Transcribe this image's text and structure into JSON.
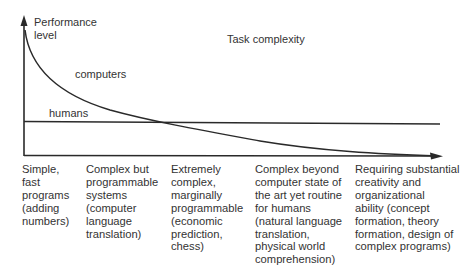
{
  "diagram": {
    "y_axis_label_line1": "Performance",
    "y_axis_label_line2": "level",
    "x_axis_title": "Task complexity",
    "series": {
      "computers": {
        "label": "computers",
        "color": "#2a2a2a"
      },
      "humans": {
        "label": "humans",
        "color": "#2a2a2a"
      }
    },
    "categories": [
      {
        "lines": [
          "Simple,",
          "fast",
          "programs",
          "(adding",
          "numbers)"
        ]
      },
      {
        "lines": [
          "Complex but",
          "programmable",
          "systems",
          "(computer",
          "language",
          "translation)"
        ]
      },
      {
        "lines": [
          "Extremely",
          "complex,",
          "marginally",
          "programmable",
          "(economic",
          "prediction,",
          "chess)"
        ]
      },
      {
        "lines": [
          "Complex beyond",
          "computer state of",
          "the art yet routine",
          "for humans",
          "(natural language",
          "translation,",
          "physical world",
          "comprehension)"
        ]
      },
      {
        "lines": [
          "Requiring substantial",
          "creativity and",
          "organizational",
          "ability (concept",
          "formation, theory",
          "formation, design  of",
          "complex programs)"
        ]
      }
    ]
  }
}
